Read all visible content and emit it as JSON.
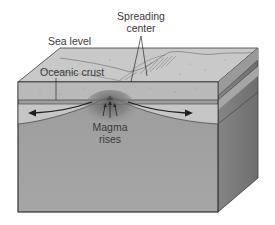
{
  "diagram": {
    "type": "block-diagram",
    "labels": {
      "spreading_center_line1": "Spreading",
      "spreading_center_line2": "center",
      "sea_level": "Sea level",
      "oceanic_crust": "Oceanic crust",
      "magma_line1": "Magma",
      "magma_line2": "rises"
    },
    "arrows": [
      {
        "name": "left-spreading-arrow",
        "direction": "left"
      },
      {
        "name": "right-spreading-arrow",
        "direction": "right"
      },
      {
        "name": "magma-rise-arrows",
        "direction": "up",
        "count": 3
      }
    ],
    "colors": {
      "top_face": "#c9c9c9",
      "front_upper_band": "#b9b9b9",
      "front_lower_band": "#c4c4c4",
      "front_mantle": "#9a9a9a",
      "right_face": "#7c7c7c",
      "right_face_band": "#a2a2a2",
      "outline": "#3c3c3c",
      "magma": "#6e6e6e",
      "text": "#3a3a3a"
    }
  }
}
